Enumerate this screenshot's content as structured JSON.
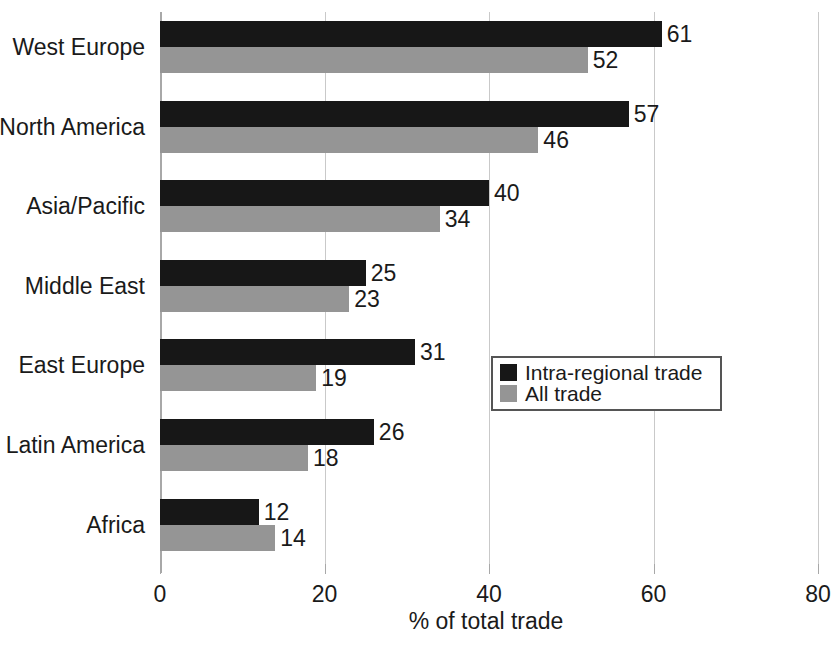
{
  "chart_data": {
    "type": "bar",
    "orientation": "horizontal",
    "title": "",
    "xlabel": "% of total trade",
    "ylabel": "",
    "xlim": [
      0,
      80
    ],
    "xticks": [
      0,
      20,
      40,
      60,
      80
    ],
    "xtick_labels": [
      "0",
      "20",
      "40",
      "60",
      "80"
    ],
    "grid": true,
    "grid_axis": "x",
    "legend_position": "center-right",
    "categories": [
      "West Europe",
      "North America",
      "Asia/Pacific",
      "Middle East",
      "East Europe",
      "Latin America",
      "Africa"
    ],
    "series": [
      {
        "name": "Intra-regional trade",
        "color": "#171717",
        "values": [
          61,
          57,
          40,
          25,
          31,
          26,
          12
        ]
      },
      {
        "name": "All trade",
        "color": "#959595",
        "values": [
          52,
          46,
          34,
          23,
          19,
          18,
          14
        ]
      }
    ]
  },
  "axis": {
    "x_title": "% of total trade",
    "tick_0": "0",
    "tick_1": "20",
    "tick_2": "40",
    "tick_3": "60",
    "tick_4": "80"
  },
  "legend": {
    "items": [
      {
        "label": "Intra-regional trade",
        "color": "#171717"
      },
      {
        "label": "All trade",
        "color": "#959595"
      }
    ]
  },
  "categories": [
    {
      "label": "West Europe",
      "intra": "61",
      "all": "52"
    },
    {
      "label": "North America",
      "intra": "57",
      "all": "46"
    },
    {
      "label": "Asia/Pacific",
      "intra": "40",
      "all": "34"
    },
    {
      "label": "Middle East",
      "intra": "25",
      "all": "23"
    },
    {
      "label": "East Europe",
      "intra": "31",
      "all": "19"
    },
    {
      "label": "Latin America",
      "intra": "26",
      "all": "18"
    },
    {
      "label": "Africa",
      "intra": "12",
      "all": "14"
    }
  ]
}
